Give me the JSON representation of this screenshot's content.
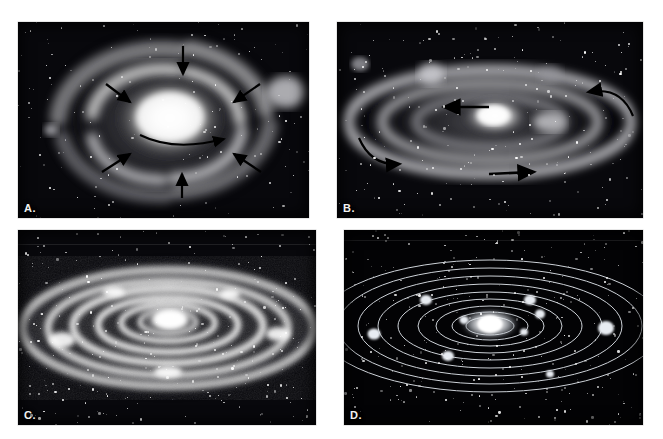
{
  "figure": {
    "top_caption": "",
    "background_color": "#ffffff",
    "width": 663,
    "height": 439
  },
  "panels": [
    {
      "id": "A",
      "label": "A.",
      "title": "Contracting proto-solar nebula with inward arrows",
      "x": 18,
      "y": 22,
      "w": 291,
      "h": 196,
      "sky_color": "#08080c",
      "nebula_color": "#d9d9d9",
      "core_color": "#ffffff",
      "arrow_color": "#000000",
      "arrow_count": 7,
      "rotation_arrow": "curved-right",
      "description": "Diffuse spiral nebula, bright central condensation, straight black arrows pointing inward from all sides, curved arrow under the core indicating rotation."
    },
    {
      "id": "B",
      "label": "B.",
      "title": "Flattened rotating disk with directional motion arrows",
      "x": 337,
      "y": 22,
      "w": 306,
      "h": 196,
      "sky_color": "#08080c",
      "nebula_color": "#cfcfcf",
      "core_color": "#ffffff",
      "arrow_color": "#000000",
      "arrow_count": 4,
      "rotation_arrow": "curved-left",
      "description": "Nebula collapsed into an inclined flattened ring system; straight and curved black arrows show the direction of rotation around the central mass."
    },
    {
      "id": "C",
      "label": "C.",
      "title": "Concentric rings of condensing material",
      "x": 18,
      "y": 230,
      "w": 298,
      "h": 195,
      "sky_color": "#08080c",
      "nebula_color": "#e8e8e8",
      "core_color": "#ffffff",
      "arrow_color": "#000000",
      "arrow_count": 0,
      "rotation_arrow": "none",
      "description": "Bright granular concentric elliptical rings separated by dark gaps, with a brilliant protosun at the center."
    },
    {
      "id": "D",
      "label": "D.",
      "title": "Finished planetary system with orbits",
      "x": 344,
      "y": 230,
      "w": 299,
      "h": 195,
      "sky_color": "#030305",
      "nebula_color": "#b9c0c8",
      "core_color": "#ffffff",
      "arrow_color": "#000000",
      "arrow_count": 0,
      "rotation_arrow": "none",
      "orbit_count": 9,
      "planet_count": 9,
      "description": "Thin white elliptical orbit lines with small glowing planets and a brilliant central star, representing the completed solar system."
    }
  ]
}
